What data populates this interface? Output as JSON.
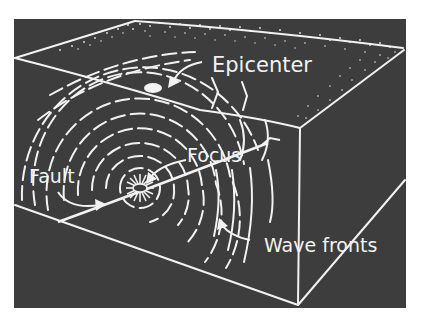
{
  "figure": {
    "colors": {
      "background": "#ffffff",
      "block": "#3d3d3d",
      "lines": "#f2f2f2"
    },
    "labels": {
      "epicenter": "Epicenter",
      "focus": "Focus",
      "fault": "Fault",
      "wave_fronts": "Wave fronts"
    }
  }
}
